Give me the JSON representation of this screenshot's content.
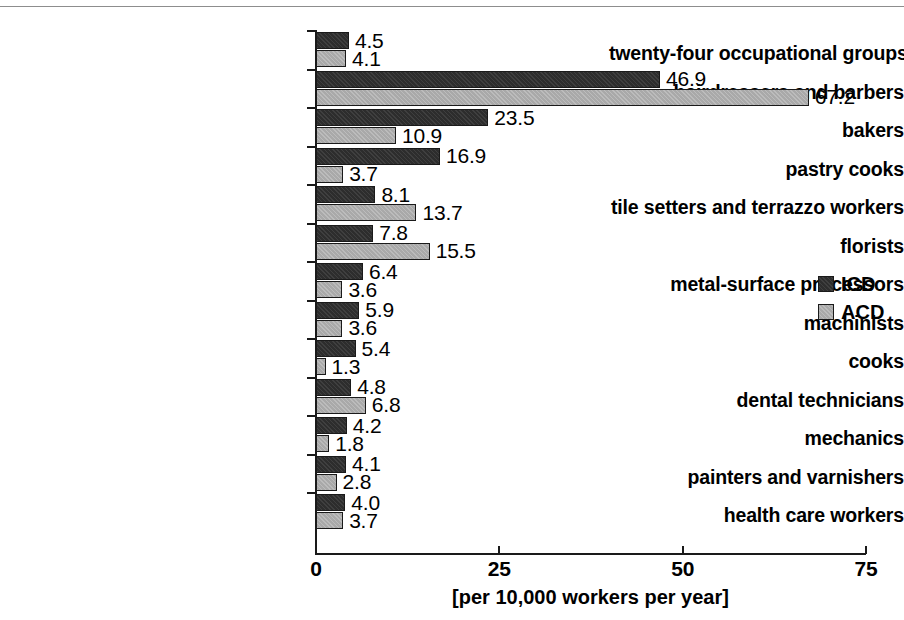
{
  "chart_data": {
    "type": "bar",
    "orientation": "horizontal",
    "title": "",
    "xlabel": "[per 10,000 workers per year]",
    "ylabel": "",
    "xlim": [
      0,
      75
    ],
    "xticks": [
      0,
      25,
      50,
      75
    ],
    "xtick_labels": [
      "0",
      "25",
      "50",
      "75"
    ],
    "grid": false,
    "legend_position": "right-middle",
    "categories": [
      "twenty-four occupational groups",
      "hairdressers and barbers",
      "bakers",
      "pastry cooks",
      "tile setters and terrazzo workers",
      "florists",
      "metal-surface processors",
      "machinists",
      "cooks",
      "dental technicians",
      "mechanics",
      "painters and varnishers",
      "health care workers"
    ],
    "series": [
      {
        "name": "ICD",
        "color": "#2d2d2d",
        "values": [
          4.5,
          46.9,
          23.5,
          16.9,
          8.1,
          7.8,
          6.4,
          5.9,
          5.4,
          4.8,
          4.2,
          4.1,
          4.0
        ],
        "value_labels": [
          "4.5",
          "46.9",
          "23.5",
          "16.9",
          "8.1",
          "7.8",
          "6.4",
          "5.9",
          "5.4",
          "4.8",
          "4.2",
          "4.1",
          "4.0"
        ]
      },
      {
        "name": "ACD",
        "color": "#a9a9a9",
        "values": [
          4.1,
          67.2,
          10.9,
          3.7,
          13.7,
          15.5,
          3.6,
          3.6,
          1.3,
          6.8,
          1.8,
          2.8,
          3.7
        ],
        "value_labels": [
          "4.1",
          "67.2",
          "10.9",
          "3.7",
          "13.7",
          "15.5",
          "3.6",
          "3.6",
          "1.3",
          "6.8",
          "1.8",
          "2.8",
          "3.7"
        ]
      }
    ]
  },
  "legend": {
    "items": [
      {
        "label": "ICD",
        "key": "icd"
      },
      {
        "label": "ACD",
        "key": "acd"
      }
    ]
  }
}
